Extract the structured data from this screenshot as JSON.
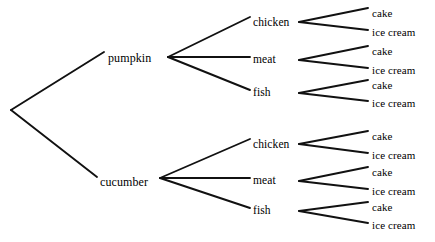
{
  "diagram": {
    "type": "probability-tree",
    "background_color": "#ffffff",
    "line_color": "#111111",
    "text_color": "#000000",
    "root": {
      "x": 11,
      "y": 110
    },
    "levels": [
      {
        "level": 1,
        "name": "starter",
        "nodes": [
          {
            "label": "pumpkin",
            "x": 108,
            "y": 58,
            "vertex_x": 168,
            "vertex_y": 57
          },
          {
            "label": "cucumber",
            "x": 100,
            "y": 182,
            "vertex_x": 160,
            "vertex_y": 178
          }
        ]
      },
      {
        "level": 2,
        "name": "main",
        "nodes": [
          {
            "label": "chicken",
            "x": 253,
            "y": 23,
            "vertex_x": 299,
            "vertex_y": 22,
            "parent": "pumpkin"
          },
          {
            "label": "meat",
            "x": 253,
            "y": 60,
            "vertex_x": 299,
            "vertex_y": 60,
            "parent": "pumpkin"
          },
          {
            "label": "fish",
            "x": 253,
            "y": 93,
            "vertex_x": 299,
            "vertex_y": 93,
            "parent": "pumpkin"
          },
          {
            "label": "chicken",
            "x": 253,
            "y": 145,
            "vertex_x": 299,
            "vertex_y": 144,
            "parent": "cucumber"
          },
          {
            "label": "meat",
            "x": 253,
            "y": 181,
            "vertex_x": 299,
            "vertex_y": 181,
            "parent": "cucumber"
          },
          {
            "label": "fish",
            "x": 253,
            "y": 211,
            "vertex_x": 299,
            "vertex_y": 211,
            "parent": "cucumber"
          }
        ]
      },
      {
        "level": 3,
        "name": "dessert",
        "nodes": [
          {
            "label": "cake",
            "x": 372,
            "y": 13,
            "parent_index": 0
          },
          {
            "label": "ice cream",
            "x": 372,
            "y": 32,
            "parent_index": 0
          },
          {
            "label": "cake",
            "x": 372,
            "y": 51,
            "parent_index": 1
          },
          {
            "label": "ice cream",
            "x": 372,
            "y": 70,
            "parent_index": 1
          },
          {
            "label": "cake",
            "x": 372,
            "y": 85,
            "parent_index": 2
          },
          {
            "label": "ice cream",
            "x": 372,
            "y": 103,
            "parent_index": 2
          },
          {
            "label": "cake",
            "x": 372,
            "y": 136,
            "parent_index": 3
          },
          {
            "label": "ice cream",
            "x": 372,
            "y": 155,
            "parent_index": 3
          },
          {
            "label": "cake",
            "x": 372,
            "y": 172,
            "parent_index": 4
          },
          {
            "label": "ice cream",
            "x": 372,
            "y": 191,
            "parent_index": 4
          },
          {
            "label": "cake",
            "x": 372,
            "y": 207,
            "parent_index": 5
          },
          {
            "label": "ice cream",
            "x": 372,
            "y": 225,
            "parent_index": 5
          }
        ]
      }
    ],
    "edges": [
      {
        "x1": 11,
        "y1": 110,
        "x2": 104,
        "y2": 52,
        "from": "root",
        "to": "pumpkin"
      },
      {
        "x1": 11,
        "y1": 110,
        "x2": 97,
        "y2": 177,
        "from": "root",
        "to": "cucumber"
      },
      {
        "x1": 168,
        "y1": 57,
        "x2": 250,
        "y2": 17,
        "from": "pumpkin",
        "to": "chicken"
      },
      {
        "x1": 168,
        "y1": 57,
        "x2": 250,
        "y2": 57,
        "from": "pumpkin",
        "to": "meat"
      },
      {
        "x1": 168,
        "y1": 57,
        "x2": 250,
        "y2": 90,
        "from": "pumpkin",
        "to": "fish"
      },
      {
        "x1": 160,
        "y1": 178,
        "x2": 250,
        "y2": 139,
        "from": "cucumber",
        "to": "chicken"
      },
      {
        "x1": 160,
        "y1": 178,
        "x2": 250,
        "y2": 178,
        "from": "cucumber",
        "to": "meat"
      },
      {
        "x1": 160,
        "y1": 178,
        "x2": 250,
        "y2": 208,
        "from": "cucumber",
        "to": "fish"
      },
      {
        "x1": 299,
        "y1": 22,
        "x2": 368,
        "y2": 8,
        "from": "chicken-1",
        "to": "cake"
      },
      {
        "x1": 299,
        "y1": 22,
        "x2": 368,
        "y2": 30,
        "from": "chicken-1",
        "to": "ice cream"
      },
      {
        "x1": 299,
        "y1": 60,
        "x2": 368,
        "y2": 46,
        "from": "meat-1",
        "to": "cake"
      },
      {
        "x1": 299,
        "y1": 60,
        "x2": 368,
        "y2": 68,
        "from": "meat-1",
        "to": "ice cream"
      },
      {
        "x1": 299,
        "y1": 93,
        "x2": 368,
        "y2": 80,
        "from": "fish-1",
        "to": "cake"
      },
      {
        "x1": 299,
        "y1": 93,
        "x2": 368,
        "y2": 101,
        "from": "fish-1",
        "to": "ice cream"
      },
      {
        "x1": 299,
        "y1": 144,
        "x2": 368,
        "y2": 131,
        "from": "chicken-2",
        "to": "cake"
      },
      {
        "x1": 299,
        "y1": 144,
        "x2": 368,
        "y2": 153,
        "from": "chicken-2",
        "to": "ice cream"
      },
      {
        "x1": 299,
        "y1": 181,
        "x2": 368,
        "y2": 167,
        "from": "meat-2",
        "to": "cake"
      },
      {
        "x1": 299,
        "y1": 181,
        "x2": 368,
        "y2": 189,
        "from": "meat-2",
        "to": "ice cream"
      },
      {
        "x1": 299,
        "y1": 211,
        "x2": 368,
        "y2": 202,
        "from": "fish-2",
        "to": "cake"
      },
      {
        "x1": 299,
        "y1": 211,
        "x2": 368,
        "y2": 223,
        "from": "fish-2",
        "to": "ice cream"
      }
    ]
  }
}
